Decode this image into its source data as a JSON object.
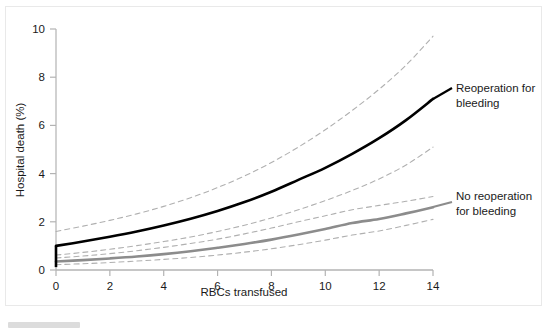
{
  "figure": {
    "background_color": "#ffffff",
    "frame_color": "#e9e9e9",
    "axis_color": "#b3b3b3"
  },
  "axes": {
    "x_title": "RBCs transfused",
    "y_title": "Hospital death (%)",
    "x_ticks": [
      "0",
      "2",
      "4",
      "6",
      "8",
      "10",
      "12",
      "14"
    ],
    "y_ticks": [
      "0",
      "2",
      "4",
      "6",
      "8",
      "10"
    ]
  },
  "annotations": {
    "reoperation_line1": "Reoperation for",
    "reoperation_line2": "bleeding",
    "no_reoperation_line1": "No reoperation",
    "no_reoperation_line2": "for bleeding"
  },
  "colors": {
    "reoperation_curve": "#000000",
    "no_reoperation_curve": "#8c8c8c",
    "confidence_band": "#b0b0b0",
    "axis": "#b3b3b3",
    "text": "#1a1a1a"
  },
  "chart_data": {
    "type": "line",
    "title": "",
    "xlabel": "RBCs transfused",
    "ylabel": "Hospital death (%)",
    "xlim": [
      0,
      14
    ],
    "ylim": [
      0,
      10
    ],
    "xticks": [
      0,
      2,
      4,
      6,
      8,
      10,
      12,
      14
    ],
    "yticks": [
      0,
      2,
      4,
      6,
      8,
      10
    ],
    "grid": false,
    "legend": "annotations-inline-right",
    "x": [
      0,
      1,
      2,
      3,
      4,
      5,
      6,
      7,
      8,
      9,
      10,
      11,
      12,
      13,
      14
    ],
    "series": [
      {
        "name": "Reoperation for bleeding",
        "style": "solid",
        "color": "#000000",
        "width": 2.6,
        "values": [
          1.0,
          1.18,
          1.38,
          1.6,
          1.85,
          2.13,
          2.45,
          2.82,
          3.25,
          3.74,
          4.24,
          4.82,
          5.47,
          6.22,
          7.1
        ]
      },
      {
        "name": "Reoperation for bleeding — upper 95% CI",
        "style": "dashed",
        "color": "#b0b0b0",
        "width": 1.1,
        "values": [
          1.6,
          1.82,
          2.06,
          2.33,
          2.64,
          3.0,
          3.42,
          3.9,
          4.46,
          5.1,
          5.82,
          6.62,
          7.5,
          8.5,
          9.7
        ]
      },
      {
        "name": "Reoperation for bleeding — lower 95% CI",
        "style": "dashed",
        "color": "#b0b0b0",
        "width": 1.1,
        "values": [
          0.62,
          0.73,
          0.86,
          1.01,
          1.18,
          1.37,
          1.6,
          1.86,
          2.16,
          2.5,
          2.88,
          3.3,
          3.78,
          4.36,
          5.1
        ]
      },
      {
        "name": "No reoperation for bleeding",
        "style": "solid",
        "color": "#8c8c8c",
        "width": 2.6,
        "values": [
          0.35,
          0.41,
          0.48,
          0.56,
          0.66,
          0.78,
          0.92,
          1.08,
          1.26,
          1.47,
          1.7,
          1.95,
          2.12,
          2.35,
          2.6
        ]
      },
      {
        "name": "No reoperation for bleeding — upper 95% CI",
        "style": "dashed",
        "color": "#b0b0b0",
        "width": 1.1,
        "values": [
          0.5,
          0.58,
          0.68,
          0.8,
          0.94,
          1.1,
          1.28,
          1.5,
          1.74,
          2.0,
          2.25,
          2.5,
          2.68,
          2.85,
          3.05
        ]
      },
      {
        "name": "No reoperation for bleeding — lower 95% CI",
        "style": "dashed",
        "color": "#b0b0b0",
        "width": 1.1,
        "values": [
          0.22,
          0.26,
          0.31,
          0.37,
          0.44,
          0.52,
          0.62,
          0.74,
          0.88,
          1.05,
          1.24,
          1.45,
          1.62,
          1.85,
          2.1
        ]
      }
    ]
  }
}
